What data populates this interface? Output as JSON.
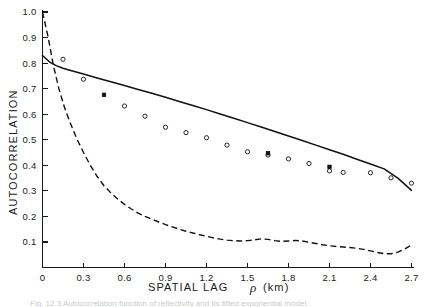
{
  "figure": {
    "caption": "Fig. 12.3   Autocorrelation function of reflectivity and its fitted exponential model."
  },
  "chart_data": {
    "type": "line",
    "title": "",
    "xlabel": "SPATIAL LAG",
    "xlabel_symbol": "ρ",
    "xlabel_units": "(km)",
    "ylabel": "AUTOCORRELATION",
    "xlim": [
      0,
      2.8
    ],
    "ylim": [
      0,
      1.0
    ],
    "grid": false,
    "legend": "none",
    "xticks": [
      0,
      0.3,
      0.6,
      0.9,
      1.2,
      1.5,
      1.8,
      2.1,
      2.4,
      2.7
    ],
    "xtick_labels": [
      "0",
      "0.3",
      "0.6",
      "0.9",
      "1.2",
      "1.5",
      "1.8",
      "2.1",
      "2.4",
      "2.7"
    ],
    "yticks": [
      0.1,
      0.2,
      0.3,
      0.4,
      0.5,
      0.6,
      0.7,
      0.8,
      0.9,
      1.0
    ],
    "ytick_labels": [
      "0.1",
      "0.2",
      "0.3",
      "0.4",
      "0.5",
      "0.6",
      "0.7",
      "0.8",
      "0.9",
      "1.0"
    ],
    "series": [
      {
        "name": "fitted-model-solid-curve",
        "style": "solid",
        "color": "#111111",
        "x": [
          0.0,
          0.05,
          0.1,
          0.15,
          0.2,
          0.3,
          0.4,
          0.5,
          0.6,
          0.7,
          0.8,
          0.9,
          1.0,
          1.1,
          1.2,
          1.3,
          1.4,
          1.5,
          1.6,
          1.7,
          1.8,
          1.9,
          2.0,
          2.1,
          2.2,
          2.3,
          2.4,
          2.5,
          2.6,
          2.7
        ],
        "y": [
          0.83,
          0.805,
          0.79,
          0.78,
          0.772,
          0.757,
          0.742,
          0.727,
          0.712,
          0.697,
          0.682,
          0.666,
          0.65,
          0.634,
          0.618,
          0.601,
          0.584,
          0.567,
          0.55,
          0.532,
          0.515,
          0.497,
          0.479,
          0.461,
          0.443,
          0.424,
          0.405,
          0.386,
          0.35,
          0.302
        ]
      },
      {
        "name": "empirical-autocorrelation-dashed-curve",
        "style": "dashed",
        "color": "#111111",
        "x": [
          0.0,
          0.04,
          0.08,
          0.12,
          0.16,
          0.2,
          0.25,
          0.3,
          0.35,
          0.4,
          0.45,
          0.5,
          0.55,
          0.6,
          0.65,
          0.7,
          0.75,
          0.8,
          0.85,
          0.9,
          0.95,
          1.0,
          1.05,
          1.1,
          1.15,
          1.2,
          1.25,
          1.3,
          1.35,
          1.4,
          1.45,
          1.5,
          1.55,
          1.6,
          1.65,
          1.7,
          1.75,
          1.8,
          1.85,
          1.9,
          1.95,
          2.0,
          2.05,
          2.1,
          2.15,
          2.2,
          2.25,
          2.3,
          2.35,
          2.4,
          2.45,
          2.5,
          2.55,
          2.6,
          2.65,
          2.7
        ],
        "y": [
          1.0,
          0.905,
          0.79,
          0.7,
          0.628,
          0.57,
          0.505,
          0.45,
          0.4,
          0.356,
          0.32,
          0.292,
          0.268,
          0.247,
          0.229,
          0.213,
          0.2,
          0.189,
          0.178,
          0.168,
          0.159,
          0.15,
          0.142,
          0.135,
          0.128,
          0.122,
          0.116,
          0.111,
          0.107,
          0.105,
          0.104,
          0.105,
          0.108,
          0.112,
          0.11,
          0.105,
          0.102,
          0.104,
          0.106,
          0.104,
          0.099,
          0.094,
          0.089,
          0.085,
          0.082,
          0.08,
          0.078,
          0.075,
          0.071,
          0.065,
          0.059,
          0.054,
          0.054,
          0.06,
          0.072,
          0.088
        ]
      }
    ],
    "scatter_open_circles": {
      "name": "observed-autocorrelation-points",
      "marker": "open-circle",
      "x": [
        0.15,
        0.3,
        0.6,
        0.75,
        0.9,
        1.05,
        1.2,
        1.35,
        1.5,
        1.65,
        1.8,
        1.95,
        2.1,
        2.2,
        2.4,
        2.55,
        2.7
      ],
      "y": [
        0.815,
        0.737,
        0.632,
        0.592,
        0.549,
        0.528,
        0.508,
        0.479,
        0.453,
        0.44,
        0.425,
        0.407,
        0.378,
        0.372,
        0.371,
        0.351,
        0.33
      ]
    },
    "scatter_filled_points": {
      "name": "fitted-sample-points",
      "marker": "filled-square",
      "x": [
        0.45,
        1.65,
        2.1
      ],
      "y": [
        0.676,
        0.447,
        0.394
      ]
    }
  },
  "axes": {
    "y_title": "AUTOCORRELATION",
    "x_title_main": "SPATIAL LAG",
    "x_title_symbol": "ρ",
    "x_title_units": "(km)"
  }
}
